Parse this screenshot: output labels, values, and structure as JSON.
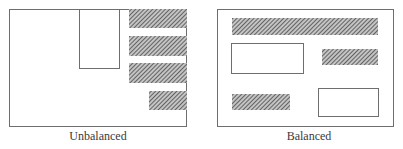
{
  "panels": [
    {
      "id": "unbalanced",
      "label": "Unbalanced",
      "elements": [
        {
          "kind": "plain-box"
        },
        {
          "kind": "hatched-bar"
        },
        {
          "kind": "hatched-bar"
        },
        {
          "kind": "hatched-bar"
        },
        {
          "kind": "hatched-bar"
        }
      ]
    },
    {
      "id": "balanced",
      "label": "Balanced",
      "elements": [
        {
          "kind": "hatched-bar"
        },
        {
          "kind": "plain-box"
        },
        {
          "kind": "hatched-bar"
        },
        {
          "kind": "hatched-bar"
        },
        {
          "kind": "plain-box"
        }
      ]
    }
  ],
  "colors": {
    "outline": "#6e6e6e",
    "hatch_fill": "#5a5a5a",
    "hatch_bg": "#c8c8c8"
  }
}
